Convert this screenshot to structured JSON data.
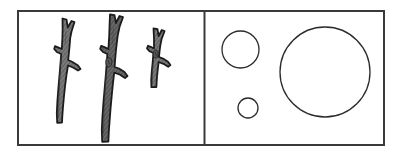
{
  "figure": {
    "type": "two-panel-line-drawing",
    "caption": "",
    "background_color": "#ffffff",
    "outline_color": "#2b2b2b",
    "canvas": {
      "width": 401,
      "height": 157
    },
    "frame": {
      "name": "outer-frame",
      "x": 17,
      "y": 10,
      "width": 368,
      "height": 136,
      "stroke_color": "#3a3a3a",
      "stroke_width": 2,
      "fill": "#ffffff"
    },
    "divider": {
      "name": "panel-divider",
      "x": 204,
      "y_top": 10,
      "y_bottom": 146,
      "stroke_color": "#3a3a3a",
      "stroke_width": 2
    },
    "panels": [
      {
        "id": "left-panel",
        "label": "branches",
        "content_kind": "shaded-twigs",
        "item_count": 3,
        "x": 17,
        "y": 10,
        "width": 187,
        "height": 136
      },
      {
        "id": "right-panel",
        "label": "circles",
        "content_kind": "open-circles",
        "item_count": 3,
        "x": 204,
        "y": 10,
        "width": 181,
        "height": 136
      }
    ],
    "branches": [
      {
        "id": "branch-left",
        "name": "branch-short-left",
        "order": 1,
        "top_y": 18,
        "bottom_y": 123,
        "height_px": 105,
        "trunk_width_px": 11,
        "fork_count": 1,
        "side_stub_count": 1,
        "fill_color": "#6e6e6e",
        "stroke_color": "#1c1c1c",
        "hatched": true
      },
      {
        "id": "branch-middle",
        "name": "branch-tall-middle",
        "order": 2,
        "top_y": 14,
        "bottom_y": 142,
        "height_px": 128,
        "trunk_width_px": 13,
        "fork_count": 1,
        "side_stub_count": 1,
        "knot_count": 1,
        "fill_color": "#6e6e6e",
        "stroke_color": "#1c1c1c",
        "hatched": true
      },
      {
        "id": "branch-right",
        "name": "branch-shortest-right",
        "order": 3,
        "top_y": 28,
        "bottom_y": 87,
        "height_px": 59,
        "trunk_width_px": 10,
        "fork_count": 1,
        "side_stub_count": 1,
        "knot_count": 1,
        "fill_color": "#6e6e6e",
        "stroke_color": "#1c1c1c",
        "hatched": true
      }
    ],
    "circles": [
      {
        "id": "circle-medium",
        "name": "circle-medium",
        "cx": 240.5,
        "cy": 49.5,
        "r": 18.5,
        "diameter_px": 37,
        "fill": "none",
        "stroke_color": "#2b2b2b",
        "stroke_width": 1.3
      },
      {
        "id": "circle-small",
        "name": "circle-small",
        "cx": 248,
        "cy": 108,
        "r": 10,
        "diameter_px": 20,
        "fill": "none",
        "stroke_color": "#2b2b2b",
        "stroke_width": 1.3
      },
      {
        "id": "circle-large",
        "name": "circle-large",
        "cx": 325,
        "cy": 72,
        "r": 45,
        "diameter_px": 90,
        "fill": "none",
        "stroke_color": "#2b2b2b",
        "stroke_width": 1.3
      }
    ]
  }
}
